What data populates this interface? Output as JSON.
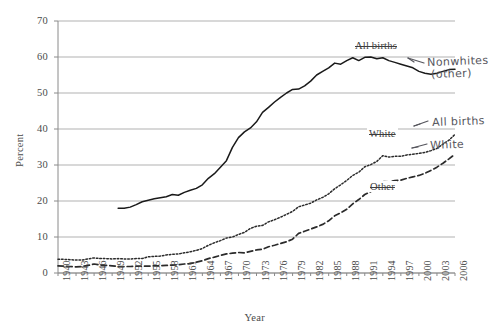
{
  "chart_data": {
    "type": "line",
    "title": "",
    "xlabel": "Year",
    "ylabel": "Percent",
    "ylim": [
      0,
      70
    ],
    "ytick_step": 10,
    "yticks": [
      70,
      60,
      50,
      40,
      30,
      20,
      10,
      0
    ],
    "xlim": [
      1940,
      2006
    ],
    "xticks": [
      1940,
      1943,
      1946,
      1949,
      1952,
      1955,
      1958,
      1961,
      1964,
      1967,
      1970,
      1973,
      1976,
      1979,
      1982,
      1985,
      1988,
      1991,
      1994,
      1997,
      2000,
      2003,
      2006
    ],
    "grid": "horizontal",
    "legend_position": "inline-annotations",
    "x": [
      1940,
      1941,
      1942,
      1943,
      1944,
      1945,
      1946,
      1947,
      1948,
      1949,
      1950,
      1951,
      1952,
      1953,
      1954,
      1955,
      1956,
      1957,
      1958,
      1959,
      1960,
      1961,
      1962,
      1963,
      1964,
      1965,
      1966,
      1967,
      1968,
      1969,
      1970,
      1971,
      1972,
      1973,
      1974,
      1975,
      1976,
      1977,
      1978,
      1979,
      1980,
      1981,
      1982,
      1983,
      1984,
      1985,
      1986,
      1987,
      1988,
      1989,
      1990,
      1991,
      1992,
      1993,
      1994,
      1995,
      1996,
      1997,
      1998,
      1999,
      2000,
      2001,
      2002,
      2003,
      2004,
      2005,
      2006
    ],
    "series": [
      {
        "name": "Nonwhites (other)",
        "printed_label": "All births",
        "style": "solid",
        "color": "#1a1a1a",
        "start_year": 1950,
        "values": [
          null,
          null,
          null,
          null,
          null,
          null,
          null,
          null,
          null,
          null,
          18.0,
          18.0,
          18.3,
          19.0,
          19.8,
          20.2,
          20.6,
          20.9,
          21.2,
          21.8,
          21.6,
          22.4,
          23.0,
          23.5,
          24.5,
          26.3,
          27.6,
          29.4,
          31.2,
          34.9,
          37.6,
          39.2,
          40.3,
          42.0,
          44.6,
          46.0,
          47.5,
          48.8,
          50.0,
          51.0,
          51.1,
          52.0,
          53.3,
          55.0,
          56.0,
          57.0,
          58.3,
          58.0,
          59.0,
          59.8,
          59.0,
          59.9,
          60.0,
          59.5,
          59.8,
          59.0,
          58.5,
          58.0,
          57.5,
          57.0,
          56.0,
          55.5,
          55.2,
          55.5,
          56.0,
          56.5,
          56.6
        ]
      },
      {
        "name": "All births",
        "printed_label": "White",
        "style": "dotted",
        "color": "#2b2b2b",
        "start_year": 1940,
        "values": [
          3.8,
          3.8,
          3.7,
          3.6,
          3.6,
          3.9,
          4.2,
          4.0,
          4.0,
          3.9,
          4.0,
          3.9,
          3.9,
          4.0,
          4.0,
          4.5,
          4.6,
          4.7,
          5.0,
          5.2,
          5.3,
          5.6,
          5.9,
          6.3,
          6.8,
          7.7,
          8.4,
          9.0,
          9.7,
          10.0,
          10.7,
          11.3,
          12.4,
          13.0,
          13.2,
          14.2,
          14.8,
          15.5,
          16.3,
          17.1,
          18.4,
          18.9,
          19.4,
          20.3,
          21.0,
          22.0,
          23.4,
          24.5,
          25.7,
          27.1,
          28.0,
          29.5,
          30.1,
          31.0,
          32.6,
          32.2,
          32.4,
          32.4,
          32.8,
          33.0,
          33.2,
          33.5,
          34.0,
          34.6,
          35.8,
          36.9,
          38.5
        ]
      },
      {
        "name": "White",
        "printed_label": "Other",
        "style": "dashed",
        "color": "#2b2b2b",
        "start_year": 1940,
        "values": [
          2.0,
          1.9,
          1.8,
          1.7,
          1.8,
          2.1,
          2.5,
          2.2,
          2.1,
          2.0,
          1.8,
          1.8,
          1.8,
          1.9,
          1.9,
          1.9,
          2.0,
          2.0,
          2.1,
          2.2,
          2.3,
          2.5,
          2.6,
          3.0,
          3.4,
          4.0,
          4.4,
          4.9,
          5.3,
          5.5,
          5.7,
          5.6,
          6.0,
          6.4,
          6.6,
          7.3,
          7.7,
          8.2,
          8.7,
          9.4,
          11.0,
          11.6,
          12.2,
          12.8,
          13.5,
          14.5,
          15.9,
          16.7,
          17.7,
          19.2,
          20.4,
          21.8,
          22.6,
          23.6,
          25.4,
          25.3,
          25.7,
          25.8,
          26.3,
          26.7,
          27.1,
          27.7,
          28.5,
          29.4,
          30.5,
          31.7,
          33.0
        ]
      }
    ],
    "printed_labels": [
      {
        "text": "All births",
        "series": "solid"
      },
      {
        "text": "White",
        "series": "dotted"
      },
      {
        "text": "Other",
        "series": "dashed"
      }
    ],
    "handwritten_annotations": [
      {
        "text": "Nonwhites\n(other)",
        "points_to": "solid"
      },
      {
        "text": "All births",
        "points_to": "dotted"
      },
      {
        "text": "White",
        "points_to": "dashed"
      }
    ]
  },
  "axes": {
    "ylabel": "Percent",
    "xlabel": "Year",
    "ytick_labels": [
      "70",
      "60",
      "50",
      "40",
      "30",
      "20",
      "10",
      "0"
    ],
    "xtick_labels": [
      "1940",
      "1943",
      "1946",
      "1949",
      "1952",
      "1955",
      "1958",
      "1961",
      "1964",
      "1967",
      "1970",
      "1973",
      "1976",
      "1979",
      "1982",
      "1985",
      "1988",
      "1991",
      "1994",
      "1997",
      "2000",
      "2003",
      "2006"
    ]
  },
  "annotations": {
    "printed": {
      "all_births": "All births",
      "white": "White",
      "other": "Other"
    },
    "handwritten": {
      "nonwhites_line1": "Nonwhites",
      "nonwhites_line2": "(other)",
      "all_births": "All births",
      "white": "White"
    }
  },
  "colors": {
    "background": "#ffffff",
    "grid": "#a8a8a8",
    "axis": "#8a8a8a",
    "line_solid": "#1a1a1a",
    "line_dotted": "#2b2b2b",
    "line_dashed": "#2b2b2b",
    "text": "#4b4b4b",
    "handwriting": "#55555c"
  }
}
